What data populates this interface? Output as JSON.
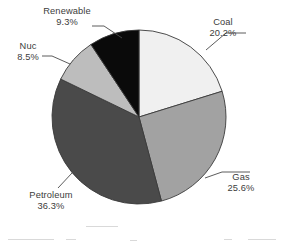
{
  "chart_data": {
    "type": "pie",
    "title": "",
    "subtitle": "",
    "xlabel": "",
    "ylabel": "",
    "legend_position": "none",
    "grid": false,
    "label_format": "name + percent",
    "start_angle_deg": 0,
    "direction": "clockwise",
    "total_percent": 99.9,
    "categories": [
      "Coal",
      "Gas",
      "Petroleum",
      "Nuc",
      "Renewable"
    ],
    "values": [
      20.2,
      25.6,
      36.3,
      8.5,
      9.3
    ],
    "value_labels": [
      "20.2%",
      "25.6%",
      "36.3%",
      "8.5%",
      "9.3%"
    ],
    "colors": [
      "#f0f0f0",
      "#a2a2a2",
      "#4a4a4a",
      "#bdbdbd",
      "#0a0a0a"
    ],
    "slices": [
      {
        "name": "Coal",
        "value": 20.2,
        "value_label": "20.2%",
        "color": "#f0f0f0"
      },
      {
        "name": "Gas",
        "value": 25.6,
        "value_label": "25.6%",
        "color": "#a2a2a2"
      },
      {
        "name": "Petroleum",
        "value": 36.3,
        "value_label": "36.3%",
        "color": "#4a4a4a"
      },
      {
        "name": "Nuc",
        "value": 8.5,
        "value_label": "8.5%",
        "color": "#bdbdbd"
      },
      {
        "name": "Renewable",
        "value": 9.3,
        "value_label": "9.3%",
        "color": "#0a0a0a"
      }
    ]
  },
  "labels": {
    "coal": {
      "name": "Coal",
      "value": "20.2%"
    },
    "gas": {
      "name": "Gas",
      "value": "25.6%"
    },
    "petroleum": {
      "name": "Petroleum",
      "value": "36.3%"
    },
    "nuc": {
      "name": "Nuc",
      "value": "8.5%"
    },
    "renewable": {
      "name": "Renewable",
      "value": "9.3%"
    }
  },
  "geometry": {
    "center_x": 139,
    "center_y": 117,
    "radius": 87
  },
  "style": {
    "background": "#ffffff",
    "outline": "#3a3a3a",
    "text": "#3c3c3c"
  }
}
